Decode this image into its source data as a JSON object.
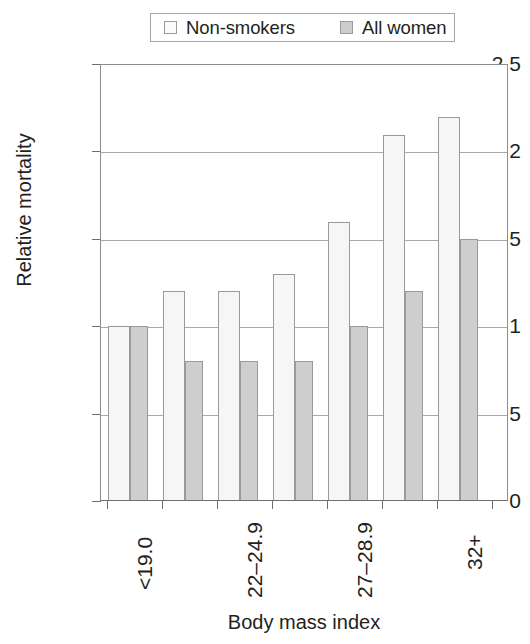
{
  "chart_data": {
    "type": "bar",
    "title": "",
    "xlabel": "Body mass index",
    "ylabel": "Relative mortality",
    "categories": [
      "<19.0",
      "19.0–21.9",
      "22–24.9",
      "25–26.9",
      "27–28.9",
      "29–31.9",
      "32+"
    ],
    "visible_tick_labels": [
      "<19.0",
      "22–24.9",
      "27–28.9",
      "32+"
    ],
    "visible_tick_category_indices": [
      0,
      2,
      4,
      6
    ],
    "series": [
      {
        "name": "Non-smokers",
        "color": "#f6f6f6",
        "values": [
          1.0,
          1.2,
          1.2,
          1.3,
          1.6,
          2.1,
          2.2
        ]
      },
      {
        "name": "All women",
        "color": "#cecece",
        "values": [
          1.0,
          0.8,
          0.8,
          0.8,
          1.0,
          1.2,
          1.5
        ]
      }
    ],
    "ylim": [
      0,
      2.5
    ],
    "yticks": [
      0,
      0.5,
      1,
      1.5,
      2,
      2.5
    ],
    "ytick_labels": [
      "0",
      "0.5",
      "1",
      "1.5",
      "2",
      "2.5"
    ],
    "grid": true,
    "grid_axis": "y",
    "legend_position": "top-center"
  },
  "legend": {
    "entries": [
      {
        "label": "Non-smokers",
        "swatch": "legend-swatch-nonsmokers"
      },
      {
        "label": "All women",
        "swatch": "legend-swatch-allwomen"
      }
    ]
  },
  "axes": {
    "y_title": "Relative mortality",
    "x_title": "Body mass index",
    "y_labels": {
      "t0": "0",
      "t1": "0.5",
      "t2": "1",
      "t3": "1.5",
      "t4": "2",
      "t5": "2.5"
    },
    "x_labels": {
      "g0": "<19.0",
      "g2": "22–24.9",
      "g4": "27–28.9",
      "g6": "32+"
    }
  },
  "colors": {
    "non_smokers_fill": "#f6f6f6",
    "all_women_fill": "#cecece",
    "bar_stroke": "#9a9a9a",
    "axis": "#6e6e6e",
    "gridline": "#a9a9a9",
    "text": "#231f20"
  }
}
